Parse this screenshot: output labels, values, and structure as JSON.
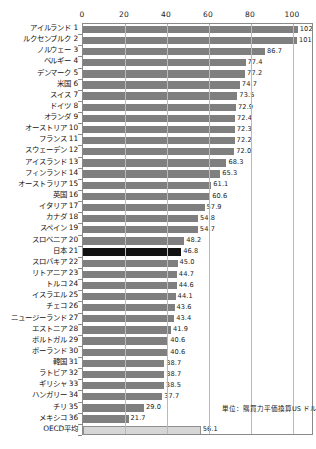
{
  "chart_data": {
    "type": "bar",
    "orientation": "horizontal",
    "title": "",
    "xlabel": "",
    "ylabel": "",
    "xlim": [
      0,
      110
    ],
    "grid": true,
    "legend": "none",
    "annotation": "単位：購買力平価換算US ドル",
    "xticks": [
      0,
      20,
      40,
      60,
      80,
      100
    ],
    "xtick_labels": [
      "0",
      "20",
      "40",
      "60",
      "80",
      "100"
    ],
    "categories": [
      "アイルランド 1",
      "ルクセンブルク 2",
      "ノルウェー 3",
      "ベルギー 4",
      "デンマーク 5",
      "米国 6",
      "スイス 7",
      "ドイツ 8",
      "オランダ 9",
      "オーストリア 10",
      "フランス 11",
      "スウェーデン 12",
      "アイスランド 13",
      "フィンランド 14",
      "オーストラリア 15",
      "英国 16",
      "イタリア 17",
      "カナダ 18",
      "スペイン 19",
      "スロベニア 20",
      "日本 21",
      "スロバキア 22",
      "リトアニア 23",
      "トルコ 24",
      "イスラエル 25",
      "チェコ 26",
      "ニュージーランド 27",
      "エストニア 28",
      "ポルトガル 29",
      "ポーランド 30",
      "韓国 31",
      "ラトビア 32",
      "ギリシャ 33",
      "ハンガリー 34",
      "チリ 35",
      "メキシコ 36",
      "OECD平均"
    ],
    "values": [
      102.3,
      101.9,
      86.7,
      77.4,
      77.2,
      74.7,
      73.5,
      72.9,
      72.4,
      72.3,
      72.2,
      72.0,
      68.3,
      65.3,
      61.1,
      60.6,
      57.9,
      54.8,
      54.7,
      48.2,
      46.8,
      45.0,
      44.7,
      44.6,
      44.1,
      43.6,
      43.4,
      41.9,
      40.6,
      40.6,
      38.7,
      38.7,
      38.5,
      37.7,
      29.0,
      21.7,
      56.1
    ],
    "value_labels": [
      "102.3",
      "101.9",
      "86.7",
      "77.4",
      "77.2",
      "74.7",
      "73.5",
      "72.9",
      "72.4",
      "72.3",
      "72.2",
      "72.0",
      "68.3",
      "65.3",
      "61.1",
      "60.6",
      "57.9",
      "54.8",
      "54.7",
      "48.2",
      "46.8",
      "45.0",
      "44.7",
      "44.6",
      "44.1",
      "43.6",
      "43.4",
      "41.9",
      "40.6",
      "40.6",
      "38.7",
      "38.7",
      "38.5",
      "37.7",
      "29.0",
      "21.7",
      "56.1"
    ],
    "highlight_index": 20,
    "average_index": 36,
    "colors": {
      "bar": "#7f7f7f",
      "highlight": "#111111",
      "average": "#d6d6d6",
      "grid": "#b9b9b9",
      "frame": "#8a8a8a",
      "text": "#1a1a1a"
    }
  }
}
